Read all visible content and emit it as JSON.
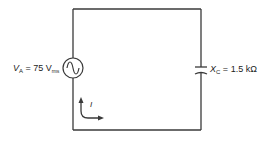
{
  "source": {
    "symbol": "V",
    "subscript": "A",
    "equals": " = ",
    "value": "75 V",
    "unit_subscript": "rms",
    "icon": "ac-source-icon"
  },
  "capacitor": {
    "symbol": "X",
    "subscript": "C",
    "equals": " = ",
    "value": "1.5 kΩ",
    "icon": "capacitor-icon"
  },
  "current": {
    "label": "I",
    "icon": "current-direction-arrow-icon"
  },
  "colors": {
    "wire": "#3a3a3a",
    "background": "#ffffff"
  }
}
